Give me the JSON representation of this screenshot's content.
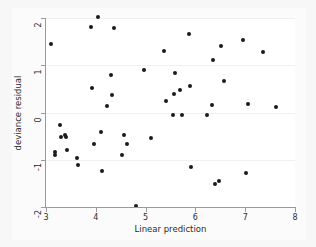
{
  "chart_data": {
    "type": "scatter",
    "title": "",
    "xlabel": "Linear prediction",
    "ylabel": "deviance residual",
    "xlim": [
      3,
      8
    ],
    "ylim": [
      -2,
      2
    ],
    "xticks": [
      3,
      4,
      5,
      6,
      7,
      8
    ],
    "yticks": [
      2,
      1,
      0,
      -1,
      -2
    ],
    "xtick_labels": [
      "3",
      "4",
      "5",
      "6",
      "7",
      "8"
    ],
    "ytick_labels": [
      "2",
      "1",
      "0",
      "-1",
      "-2"
    ],
    "grid": "horizontal",
    "legend": "none",
    "marker": {
      "shape": "circle",
      "color": "#1a1a1a",
      "size": 4
    },
    "colors": {
      "figure_background": "#f7f7f7",
      "plot_background": "#ffffff",
      "axis": "#9a9a9a",
      "gridline": "#f0f0f0",
      "text": "#2b2b2b"
    },
    "n_points": 55,
    "points": [
      {
        "x": 3.1,
        "y": 1.45
      },
      {
        "x": 3.18,
        "y": -0.83
      },
      {
        "x": 3.19,
        "y": -0.9
      },
      {
        "x": 3.28,
        "y": -0.27
      },
      {
        "x": 3.3,
        "y": -0.52
      },
      {
        "x": 3.38,
        "y": -0.48
      },
      {
        "x": 3.4,
        "y": -0.52
      },
      {
        "x": 3.42,
        "y": -0.8
      },
      {
        "x": 3.62,
        "y": -0.97
      },
      {
        "x": 3.65,
        "y": -1.12
      },
      {
        "x": 3.9,
        "y": 1.8
      },
      {
        "x": 3.92,
        "y": 0.51
      },
      {
        "x": 3.96,
        "y": -0.67
      },
      {
        "x": 4.05,
        "y": 2.03
      },
      {
        "x": 4.1,
        "y": -0.42
      },
      {
        "x": 4.12,
        "y": -1.24
      },
      {
        "x": 4.22,
        "y": 0.13
      },
      {
        "x": 4.3,
        "y": 0.79
      },
      {
        "x": 4.33,
        "y": 0.38
      },
      {
        "x": 4.37,
        "y": 1.79
      },
      {
        "x": 4.52,
        "y": -0.9
      },
      {
        "x": 4.57,
        "y": -0.47
      },
      {
        "x": 4.63,
        "y": -0.67
      },
      {
        "x": 4.8,
        "y": -1.98
      },
      {
        "x": 4.96,
        "y": 0.91
      },
      {
        "x": 5.1,
        "y": -0.55
      },
      {
        "x": 5.37,
        "y": 1.31
      },
      {
        "x": 5.4,
        "y": 0.25
      },
      {
        "x": 5.55,
        "y": -0.05
      },
      {
        "x": 5.58,
        "y": 0.4
      },
      {
        "x": 5.6,
        "y": 0.83
      },
      {
        "x": 5.7,
        "y": 0.47
      },
      {
        "x": 5.74,
        "y": -0.05
      },
      {
        "x": 5.88,
        "y": 1.67
      },
      {
        "x": 5.9,
        "y": 0.57
      },
      {
        "x": 5.91,
        "y": -1.16
      },
      {
        "x": 6.23,
        "y": -0.06
      },
      {
        "x": 6.33,
        "y": 0.15
      },
      {
        "x": 6.36,
        "y": 1.11
      },
      {
        "x": 6.4,
        "y": -1.52
      },
      {
        "x": 6.48,
        "y": -1.46
      },
      {
        "x": 6.52,
        "y": 1.41
      },
      {
        "x": 6.57,
        "y": 0.66
      },
      {
        "x": 6.95,
        "y": 1.53
      },
      {
        "x": 7.02,
        "y": -1.28
      },
      {
        "x": 7.06,
        "y": 0.17
      },
      {
        "x": 7.35,
        "y": 1.27
      },
      {
        "x": 7.62,
        "y": 0.11
      }
    ]
  }
}
